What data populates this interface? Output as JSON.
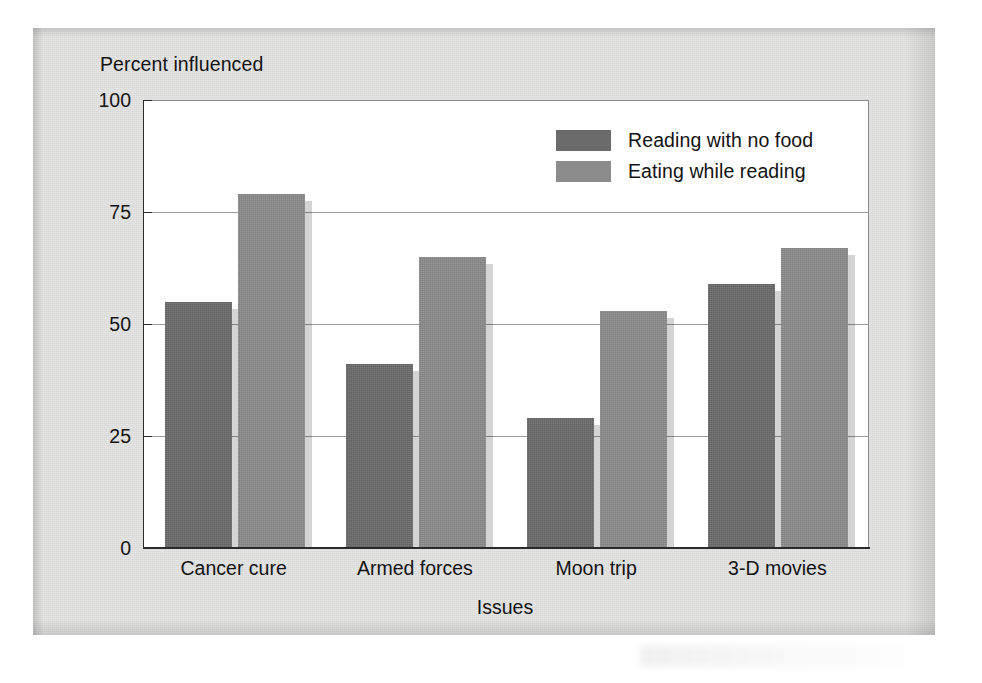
{
  "chart_data": {
    "type": "bar",
    "title": "",
    "ylabel": "Percent influenced",
    "xlabel": "Issues",
    "categories": [
      "Cancer cure",
      "Armed forces",
      "Moon trip",
      "3-D movies"
    ],
    "series": [
      {
        "name": "Reading with no food",
        "color": "#6b6b6b",
        "values": [
          55,
          41,
          29,
          59
        ]
      },
      {
        "name": "Eating while reading",
        "color": "#8c8c8c",
        "values": [
          79,
          65,
          53,
          67
        ]
      }
    ],
    "ylim": [
      0,
      100
    ],
    "yticks": [
      0,
      25,
      50,
      75,
      100
    ],
    "ytick_labels": [
      "0",
      "25",
      "50",
      "75",
      "100"
    ],
    "grid": "horizontal",
    "legend_position": "upper-right-inside"
  },
  "colors": {
    "series_dark": "#6b6b6b",
    "series_light": "#8c8c8c",
    "page_background": "#dededd",
    "plot_background": "#ffffff",
    "axis": "#2b2b2b",
    "gridline": "#9a9a9a",
    "text": "#131313"
  }
}
